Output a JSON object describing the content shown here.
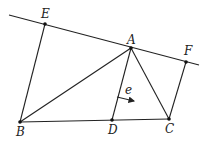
{
  "diagram": {
    "type": "geometry",
    "points": {
      "A": {
        "label": "A",
        "x": 131,
        "y": 48
      },
      "B": {
        "label": "B",
        "x": 20,
        "y": 122
      },
      "C": {
        "label": "C",
        "x": 169,
        "y": 119
      },
      "D": {
        "label": "D",
        "x": 112,
        "y": 120
      },
      "E": {
        "label": "E",
        "x": 45,
        "y": 24
      },
      "F": {
        "label": "F",
        "x": 186,
        "y": 62
      }
    },
    "line_EF": {
      "x1": 9,
      "y1": 15,
      "x2": 199,
      "y2": 65
    },
    "segments": [
      "EB",
      "BA",
      "AC",
      "AD",
      "BC",
      "FC"
    ],
    "vector": {
      "label": "e",
      "x1": 117,
      "y1": 97,
      "x2": 135,
      "y2": 101
    }
  }
}
